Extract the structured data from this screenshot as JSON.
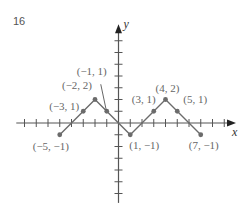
{
  "exercise_number": "16",
  "colors": {
    "axis": "#555555",
    "graph": "#6b6b6b",
    "point": "#6b6b6b",
    "label": "#666666"
  },
  "chart_data": {
    "type": "line",
    "title": "",
    "xlabel": "x",
    "ylabel": "y",
    "xlim": [
      -8.7,
      10
    ],
    "ylim": [
      -6.8,
      8.4
    ],
    "x_ticks": [
      -8,
      -7,
      -6,
      -5,
      -4,
      -3,
      -2,
      -1,
      1,
      2,
      3,
      4,
      5,
      6,
      7,
      8,
      9
    ],
    "y_ticks": [
      -6,
      -5,
      -4,
      -3,
      -2,
      -1,
      1,
      2,
      3,
      4,
      5,
      6,
      7
    ],
    "grid": false,
    "series": [
      {
        "name": "graph",
        "x": [
          -5,
          -3,
          -2,
          -1,
          1,
          3,
          4,
          5,
          7
        ],
        "y": [
          -1,
          1,
          2,
          1,
          -1,
          1,
          2,
          1,
          -1
        ]
      }
    ],
    "points": [
      {
        "x": -5,
        "y": -1,
        "label": "(−5, −1)"
      },
      {
        "x": -3,
        "y": 1,
        "label": "(−3, 1)"
      },
      {
        "x": -2,
        "y": 2,
        "label": "(−2, 2)"
      },
      {
        "x": -1,
        "y": 1,
        "label": "(−1, 1)"
      },
      {
        "x": 1,
        "y": -1,
        "label": "(1, −1)"
      },
      {
        "x": 3,
        "y": 1,
        "label": "(3, 1)"
      },
      {
        "x": 4,
        "y": 2,
        "label": "(4, 2)"
      },
      {
        "x": 5,
        "y": 1,
        "label": "(5, 1)"
      },
      {
        "x": 7,
        "y": -1,
        "label": "(7, −1)"
      }
    ]
  }
}
